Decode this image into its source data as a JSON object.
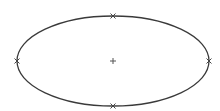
{
  "diagram": {
    "type": "ellipse-sketch",
    "canvas": {
      "width": 220,
      "height": 111,
      "background": "#ffffff"
    },
    "ellipse": {
      "cx": 113,
      "cy": 61,
      "rx": 96,
      "ry": 45,
      "stroke": "#3a3a3a",
      "stroke_width": 1.3
    },
    "center_marker": {
      "x": 113,
      "y": 61,
      "glyph": "plus-icon",
      "color": "#555555"
    },
    "control_points": [
      {
        "name": "top",
        "x": 113,
        "y": 16
      },
      {
        "name": "bottom",
        "x": 113,
        "y": 106
      },
      {
        "name": "left",
        "x": 17,
        "y": 61
      },
      {
        "name": "right",
        "x": 209,
        "y": 61
      }
    ],
    "marker_color": "#444444"
  }
}
